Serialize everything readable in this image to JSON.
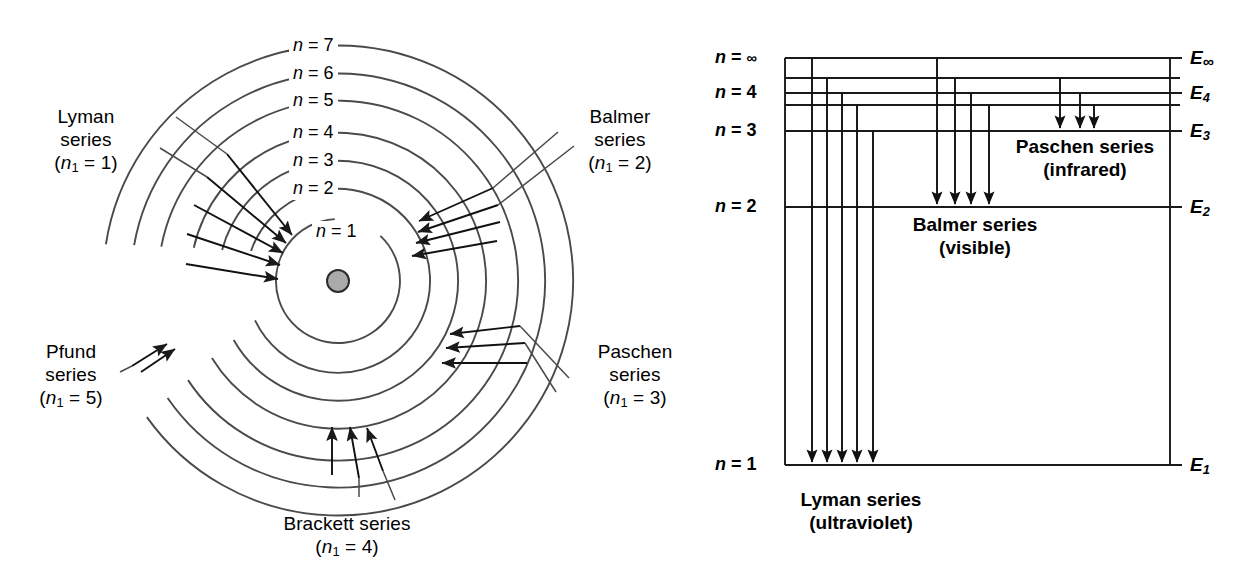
{
  "figure": {
    "colors": {
      "line": "#3b3b3b",
      "stroke": "#1a1a1a",
      "nucleus_fill": "#aaaaaa",
      "nucleus_stroke": "#2b2b2b",
      "text": "#000000",
      "background": "#ffffff"
    }
  },
  "bohr_diagram": {
    "name": "bohr-orbit-diagram",
    "center": {
      "x": 338,
      "y": 281
    },
    "nucleus_radius": 11,
    "orbits": [
      {
        "n": 1,
        "label": "n = 1",
        "radius": 62
      },
      {
        "n": 2,
        "label": "n = 2",
        "radius": 92
      },
      {
        "n": 3,
        "label": "n = 3",
        "radius": 120
      },
      {
        "n": 4,
        "label": "n = 4",
        "radius": 148
      },
      {
        "n": 5,
        "label": "n = 5",
        "radius": 180
      },
      {
        "n": 6,
        "label": "n = 6",
        "radius": 207
      },
      {
        "n": 7,
        "label": "n = 7",
        "radius": 235
      }
    ],
    "orbit_label_texts": [
      "n = 7",
      "n = 6",
      "n = 5",
      "n = 4",
      "n = 3",
      "n = 2",
      "n = 1"
    ],
    "series": [
      {
        "key": "lyman",
        "name_line1": "Lyman",
        "name_line2": "series",
        "subscript_line": "(n1 = 1)",
        "n_lower": 1,
        "arrow_count": 5,
        "arrow_targets": [
          2,
          3,
          4,
          5,
          6
        ],
        "side": "upper-left"
      },
      {
        "key": "balmer",
        "name_line1": "Balmer",
        "name_line2": "series",
        "subscript_line": "(n1 = 2)",
        "n_lower": 2,
        "arrow_count": 4,
        "arrow_targets": [
          3,
          4,
          5,
          6
        ],
        "side": "upper-right"
      },
      {
        "key": "paschen",
        "name_line1": "Paschen",
        "name_line2": "series",
        "subscript_line": "(n1 = 3)",
        "n_lower": 3,
        "arrow_count": 3,
        "arrow_targets": [
          4,
          5,
          6
        ],
        "side": "lower-right"
      },
      {
        "key": "brackett",
        "name_line1": "Brackett series",
        "name_line2": "",
        "subscript_line": "(n1 = 4)",
        "n_lower": 4,
        "arrow_count": 3,
        "arrow_targets": [
          5,
          6,
          7
        ],
        "side": "bottom"
      },
      {
        "key": "pfund",
        "name_line1": "Pfund",
        "name_line2": "series",
        "subscript_line": "(n1 = 5)",
        "n_lower": 5,
        "arrow_count": 2,
        "arrow_targets": [
          6,
          7
        ],
        "side": "lower-left"
      }
    ]
  },
  "energy_diagram": {
    "name": "energy-level-diagram",
    "plot_left": 785,
    "plot_right": 1170,
    "levels": [
      {
        "n_label": "n = ∞",
        "e_label": "E∞",
        "y": 58,
        "labeled": true
      },
      {
        "n_label": "",
        "e_label": "",
        "y": 78,
        "labeled": false
      },
      {
        "n_label": "n = 4",
        "e_label": "E4",
        "y": 93,
        "labeled": true
      },
      {
        "n_label": "",
        "e_label": "",
        "y": 105,
        "labeled": false
      },
      {
        "n_label": "n = 3",
        "e_label": "E3",
        "y": 131,
        "labeled": true
      },
      {
        "n_label": "n = 2",
        "e_label": "E2",
        "y": 207,
        "labeled": true
      },
      {
        "n_label": "n = 1",
        "e_label": "E1",
        "y": 465,
        "labeled": true
      }
    ],
    "n_labels": [
      "n = ∞",
      "n = 4",
      "n = 3",
      "n = 2",
      "n = 1"
    ],
    "e_labels": [
      "E∞",
      "E4",
      "E3",
      "E2",
      "E1"
    ],
    "transitions": [
      {
        "series": "lyman",
        "label_line1": "Lyman series",
        "label_line2": "(ultraviolet)",
        "to_level_y": 465,
        "arrows": [
          {
            "x": 812,
            "from_y": 58
          },
          {
            "x": 827,
            "from_y": 78
          },
          {
            "x": 842,
            "from_y": 93
          },
          {
            "x": 857,
            "from_y": 105
          },
          {
            "x": 873,
            "from_y": 131
          }
        ]
      },
      {
        "series": "balmer",
        "label_line1": "Balmer series",
        "label_line2": "(visible)",
        "to_level_y": 207,
        "arrows": [
          {
            "x": 937,
            "from_y": 58
          },
          {
            "x": 955,
            "from_y": 78
          },
          {
            "x": 971,
            "from_y": 93
          },
          {
            "x": 989,
            "from_y": 105
          }
        ]
      },
      {
        "series": "paschen",
        "label_line1": "Paschen series",
        "label_line2": "(infrared)",
        "to_level_y": 131,
        "arrows": [
          {
            "x": 1060,
            "from_y": 78
          },
          {
            "x": 1080,
            "from_y": 93
          },
          {
            "x": 1094,
            "from_y": 105
          }
        ]
      }
    ]
  }
}
